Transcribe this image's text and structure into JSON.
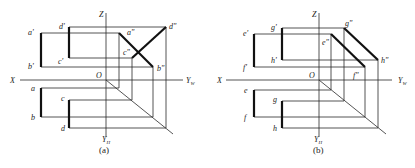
{
  "figures": [
    {
      "id": "a",
      "caption": "(a)",
      "axes": {
        "x": "X",
        "z": "Z",
        "yw": "Y",
        "yw_sub": "W",
        "yh": "Y",
        "yh_sub": "H",
        "origin": "O"
      },
      "points": {
        "front": [
          "a'",
          "b'",
          "c'",
          "d'"
        ],
        "side": [
          "a\"",
          "b\"",
          "c\"",
          "d\""
        ],
        "top": [
          "a",
          "b",
          "c",
          "d"
        ]
      }
    },
    {
      "id": "b",
      "caption": "(b)",
      "axes": {
        "x": "X",
        "z": "Z",
        "yw": "Y",
        "yw_sub": "W",
        "yh": "Y",
        "yh_sub": "H",
        "origin": "O"
      },
      "points": {
        "front": [
          "e'",
          "f'",
          "g'",
          "h'"
        ],
        "side": [
          "e\"",
          "f\"",
          "g\"",
          "h\""
        ],
        "top": [
          "e",
          "f",
          "g",
          "h"
        ]
      }
    }
  ]
}
